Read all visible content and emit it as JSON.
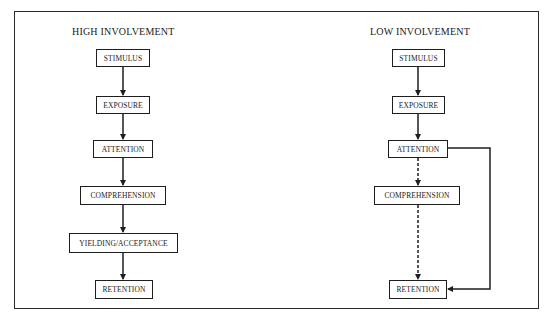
{
  "diagram": {
    "panels": [
      {
        "title": "HIGH INVOLVEMENT",
        "steps": [
          "STIMULUS",
          "EXPOSURE",
          "ATTENTION",
          "COMPREHENSION",
          "YIELDING/ACCEPTANCE",
          "RETENTION"
        ],
        "connections": [
          {
            "from": "STIMULUS",
            "to": "EXPOSURE",
            "style": "solid"
          },
          {
            "from": "EXPOSURE",
            "to": "ATTENTION",
            "style": "solid"
          },
          {
            "from": "ATTENTION",
            "to": "COMPREHENSION",
            "style": "solid"
          },
          {
            "from": "COMPREHENSION",
            "to": "YIELDING/ACCEPTANCE",
            "style": "solid"
          },
          {
            "from": "YIELDING/ACCEPTANCE",
            "to": "RETENTION",
            "style": "solid"
          }
        ]
      },
      {
        "title": "LOW INVOLVEMENT",
        "steps": [
          "STIMULUS",
          "EXPOSURE",
          "ATTENTION",
          "COMPREHENSION",
          "RETENTION"
        ],
        "connections": [
          {
            "from": "STIMULUS",
            "to": "EXPOSURE",
            "style": "solid"
          },
          {
            "from": "EXPOSURE",
            "to": "ATTENTION",
            "style": "solid"
          },
          {
            "from": "ATTENTION",
            "to": "COMPREHENSION",
            "style": "dashed"
          },
          {
            "from": "COMPREHENSION",
            "to": "RETENTION",
            "style": "dashed"
          },
          {
            "from": "ATTENTION",
            "to": "RETENTION",
            "style": "solid",
            "route": "bypass-right"
          }
        ]
      }
    ],
    "colors": {
      "line": "#1e1e1e",
      "background": "#ffffff"
    }
  }
}
